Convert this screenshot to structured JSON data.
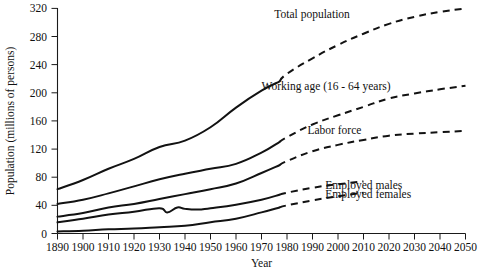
{
  "chart_data": {
    "type": "line",
    "title": "",
    "xlabel": "Year",
    "ylabel": "Population (millions of persons)",
    "xlim": [
      1890,
      2050
    ],
    "ylim": [
      0,
      320
    ],
    "grid": false,
    "legend_position": "inline-annotations",
    "xticks": [
      1890,
      1900,
      1910,
      1920,
      1930,
      1940,
      1950,
      1960,
      1970,
      1980,
      1990,
      2000,
      2010,
      2020,
      2030,
      2040,
      2050
    ],
    "xtick_labels": [
      "1890",
      "1900",
      "1910",
      "1920",
      "1930",
      "1940",
      "1950",
      "1960",
      "1970",
      "1980",
      "1990",
      "2000",
      "2010",
      "2020",
      "2030",
      "2040",
      "2050"
    ],
    "yticks": [
      0,
      40,
      80,
      120,
      160,
      200,
      240,
      280,
      320
    ],
    "ytick_labels": [
      "0",
      "40",
      "80",
      "120",
      "160",
      "200",
      "240",
      "280",
      "320"
    ],
    "projection_start_year": 1977,
    "series": [
      {
        "name": "Total population",
        "label": "Total population",
        "style": "solid-then-dashed",
        "x": [
          1890,
          1900,
          1910,
          1920,
          1930,
          1940,
          1950,
          1960,
          1970,
          1977,
          1980,
          1990,
          2000,
          2010,
          2020,
          2030,
          2040,
          2050
        ],
        "values": [
          63,
          76,
          92,
          106,
          123,
          132,
          151,
          179,
          203,
          216,
          227,
          249,
          268,
          284,
          298,
          308,
          315,
          320
        ]
      },
      {
        "name": "Working age (16 - 64 years)",
        "label": "Working age (16 - 64 years)",
        "style": "solid-then-dashed",
        "x": [
          1890,
          1900,
          1910,
          1920,
          1930,
          1940,
          1950,
          1960,
          1970,
          1977,
          1980,
          1990,
          2000,
          2010,
          2020,
          2030,
          2040,
          2050
        ],
        "values": [
          42,
          48,
          57,
          67,
          77,
          85,
          92,
          99,
          115,
          130,
          137,
          155,
          168,
          180,
          192,
          199,
          205,
          210
        ]
      },
      {
        "name": "Labor force",
        "label": "Labor force",
        "style": "solid-then-dashed",
        "x": [
          1890,
          1900,
          1910,
          1920,
          1930,
          1940,
          1950,
          1960,
          1970,
          1977,
          1980,
          1990,
          2000,
          2010,
          2020,
          2030,
          2040,
          2050
        ],
        "values": [
          24,
          29,
          37,
          42,
          49,
          56,
          63,
          71,
          86,
          97,
          103,
          117,
          126,
          133,
          139,
          142,
          144,
          146
        ]
      },
      {
        "name": "Employed males",
        "label": "Employed males",
        "style": "solid-then-dashed",
        "x": [
          1890,
          1900,
          1910,
          1920,
          1930,
          1933,
          1937,
          1940,
          1945,
          1950,
          1960,
          1970,
          1977,
          1980,
          1990,
          2000,
          2010
        ],
        "values": [
          16,
          21,
          27,
          31,
          36,
          30,
          37,
          35,
          34,
          36,
          41,
          48,
          55,
          58,
          65,
          70,
          74
        ]
      },
      {
        "name": "Employed females",
        "label": "Employed females",
        "style": "solid-then-dashed",
        "x": [
          1890,
          1900,
          1910,
          1920,
          1930,
          1940,
          1950,
          1960,
          1970,
          1977,
          1980,
          1990,
          2000,
          2010
        ],
        "values": [
          3,
          4,
          6,
          7,
          9,
          11,
          16,
          21,
          30,
          37,
          40,
          47,
          53,
          58
        ]
      }
    ],
    "annotations": [
      {
        "text": "Total population",
        "x": 1975,
        "y": 306
      },
      {
        "text": "Working age (16 - 64 years)",
        "x": 1970,
        "y": 204
      },
      {
        "text": "Labor force",
        "x": 1988,
        "y": 141
      },
      {
        "text": "Employed males",
        "x": 1995,
        "y": 64
      },
      {
        "text": "Employed females",
        "x": 1995,
        "y": 50
      }
    ]
  }
}
